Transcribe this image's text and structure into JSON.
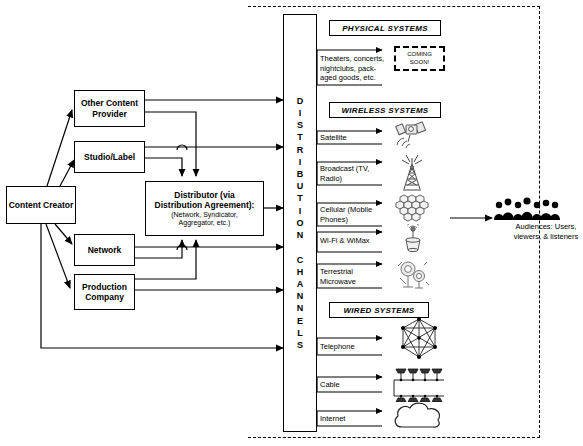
{
  "diagram": {
    "left_entities": [
      {
        "id": "content-creator",
        "label": "Content Creator"
      },
      {
        "id": "other-content-provider",
        "label": "Other Content Provider"
      },
      {
        "id": "studio-label",
        "label": "Studio/Label"
      },
      {
        "id": "network",
        "label": "Network"
      },
      {
        "id": "production-company",
        "label": "Production Company"
      }
    ],
    "distributor": {
      "title_line1": "Distributor (via",
      "title_line2": "Distribution Agreement):",
      "subtitle_line1": "(Network, Syndicator,",
      "subtitle_line2": "Aggregator, etc.)"
    },
    "channel_column": {
      "letters": [
        "D",
        "I",
        "S",
        "T",
        "R",
        "I",
        "B",
        "U",
        "T",
        "I",
        "O",
        "N",
        "",
        "C",
        "H",
        "A",
        "N",
        "N",
        "E",
        "L",
        "S"
      ],
      "text": "DISTRIBUTION CHANNELS"
    },
    "sections": [
      {
        "id": "physical",
        "header": "PHYSICAL SYSTEMS"
      },
      {
        "id": "wireless",
        "header": "WIRELESS SYSTEMS"
      },
      {
        "id": "wired",
        "header": "WIRED SYSTEMS"
      }
    ],
    "channels": [
      {
        "id": "theaters",
        "section": "physical",
        "label_lines": [
          "Theaters, concerts,",
          "nightclubs, pack-",
          "aged goods, etc."
        ],
        "icon": "coming-soon-box"
      },
      {
        "id": "satellite",
        "section": "wireless",
        "label_lines": [
          "Satellite"
        ],
        "icon": "satellite-icon"
      },
      {
        "id": "broadcast",
        "section": "wireless",
        "label_lines": [
          "Broadcast (TV,",
          "Radio)"
        ],
        "icon": "broadcast-tower-icon"
      },
      {
        "id": "cellular",
        "section": "wireless",
        "label_lines": [
          "Cellular (Mobile",
          "Phones)"
        ],
        "icon": "cellular-honeycomb-icon"
      },
      {
        "id": "wifi-wimax",
        "section": "wireless",
        "label_lines": [
          "Wi-Fi & WiMax"
        ],
        "icon": "wifi-access-point-icon"
      },
      {
        "id": "terrestrial-microwave",
        "section": "wireless",
        "label_lines": [
          "Terrestrial",
          "Microwave"
        ],
        "icon": "microwave-dish-icon"
      },
      {
        "id": "telephone",
        "section": "wired",
        "label_lines": [
          "Telephone"
        ],
        "icon": "mesh-network-icon"
      },
      {
        "id": "cable",
        "section": "wired",
        "label_lines": [
          "Cable"
        ],
        "icon": "cable-tree-icon"
      },
      {
        "id": "internet",
        "section": "wired",
        "label_lines": [
          "Internet"
        ],
        "icon": "cloud-icon"
      }
    ],
    "coming_soon": {
      "line1": "COMING",
      "line2": "SOON!"
    },
    "audiences": {
      "icon": "audience-silhouettes-icon",
      "caption_line1": "Audiences: Users,",
      "caption_line2": "viewers, & listeners"
    },
    "colors": {
      "line": "#000000",
      "fill": "#ffffff",
      "background": "#ffffff"
    }
  }
}
